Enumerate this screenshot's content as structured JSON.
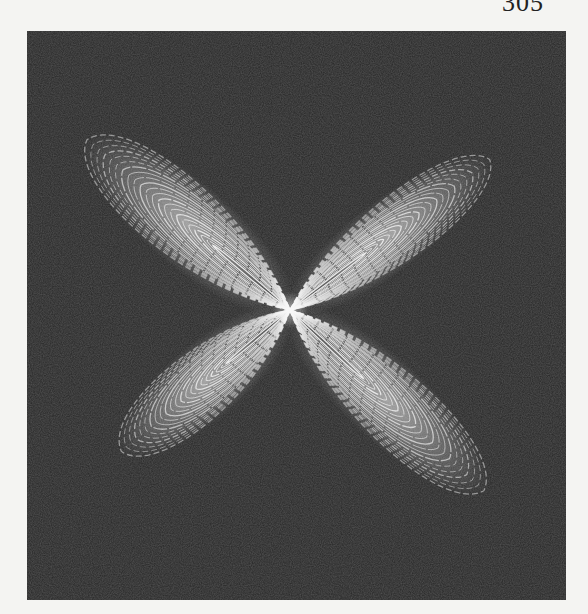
{
  "page": {
    "page_number": "305"
  },
  "figure": {
    "background_color": "#262626",
    "line_color": "#f2f2f2",
    "center": [
      263,
      279
    ],
    "lobes": [
      {
        "name": "upper-left",
        "angle_deg": -140,
        "length": 265,
        "width": 95
      },
      {
        "name": "upper-right",
        "angle_deg": -37,
        "length": 250,
        "width": 80
      },
      {
        "name": "lower-left",
        "angle_deg": 140,
        "length": 220,
        "width": 85
      },
      {
        "name": "lower-right",
        "angle_deg": 43,
        "length": 265,
        "width": 90
      }
    ]
  }
}
